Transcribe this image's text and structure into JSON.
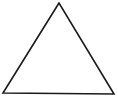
{
  "diagram": {
    "shape": "triangle",
    "vertices": [
      [
        59,
        3
      ],
      [
        3,
        93
      ],
      [
        114,
        94
      ]
    ],
    "stroke": "#1a1a1a",
    "stroke_width": 1.6,
    "fill": "#ffffff",
    "background": "#ffffff"
  }
}
